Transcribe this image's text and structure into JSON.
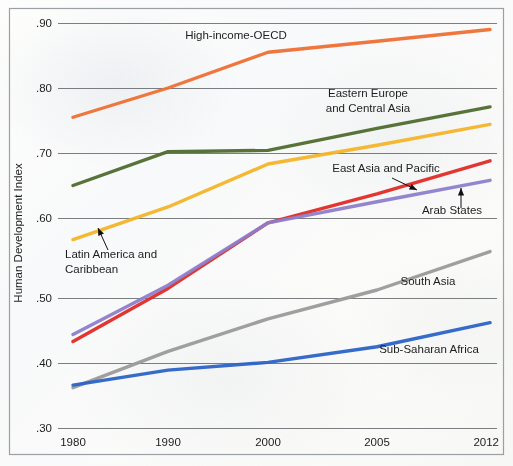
{
  "chart_data": {
    "type": "line",
    "title": "",
    "xlabel": "",
    "ylabel": "Human Development Index",
    "x": [
      "1980",
      "1990",
      "2000",
      "2005",
      "2012"
    ],
    "ylim": [
      0.3,
      0.9
    ],
    "ytick_labels": [
      ".90",
      ".80",
      ".70",
      ".60",
      ".50",
      ".40",
      ".30"
    ],
    "ytick_values": [
      0.9,
      0.8,
      0.7,
      0.6,
      0.5,
      0.4,
      0.3
    ],
    "grid": "horizontal",
    "legend": "inline-annotations",
    "series": [
      {
        "name": "High-income-OECD",
        "color": "#ee6f33",
        "values": [
          0.755,
          0.8,
          0.855,
          0.872,
          0.89
        ],
        "label_x": 236,
        "label_y": 39,
        "label_anchor": "middle",
        "annotation": "none"
      },
      {
        "name": "Eastern Europe and Central Asia",
        "color": "#4f6b2f",
        "values": [
          0.65,
          0.702,
          0.704,
          0.738,
          0.771
        ],
        "label_line1": "Eastern Europe",
        "label_line2": "and Central Asia",
        "label_x": 368,
        "label_y": 97,
        "label_anchor": "middle",
        "annotation": "none"
      },
      {
        "name": "Latin America and Caribbean",
        "color": "#f3b429",
        "values": [
          0.573,
          0.617,
          0.683,
          0.712,
          0.744
        ],
        "label_line1": "Latin America and",
        "label_line2": "Caribbean",
        "label_x": 65,
        "label_y": 258,
        "label_anchor": "start",
        "annotation": "arrow",
        "arrow_from_x": 108,
        "arrow_from_y": 250,
        "arrow_to_x": 98,
        "arrow_to_y": 228
      },
      {
        "name": "East Asia and Pacific",
        "color": "#e02b26",
        "values": [
          0.433,
          0.512,
          0.594,
          0.637,
          0.688
        ],
        "label_x": 386,
        "label_y": 172,
        "label_anchor": "middle",
        "annotation": "arrow",
        "arrow_from_x": 392,
        "arrow_from_y": 178,
        "arrow_to_x": 417,
        "arrow_to_y": 190
      },
      {
        "name": "Arab States",
        "color": "#8d7ecb",
        "values": [
          0.444,
          0.516,
          0.594,
          0.625,
          0.658
        ],
        "label_x": 452,
        "label_y": 214,
        "label_anchor": "middle",
        "annotation": "arrow",
        "arrow_from_x": 461,
        "arrow_from_y": 208,
        "arrow_to_x": 461,
        "arrow_to_y": 188
      },
      {
        "name": "South Asia",
        "color": "#9a9a9a",
        "values": [
          0.362,
          0.418,
          0.468,
          0.51,
          0.558
        ],
        "label_x": 428,
        "label_y": 285,
        "label_anchor": "middle",
        "annotation": "none"
      },
      {
        "name": "Sub-Saharan Africa",
        "color": "#2b63c6",
        "values": [
          0.366,
          0.389,
          0.401,
          0.425,
          0.462
        ],
        "label_x": 429,
        "label_y": 353,
        "label_anchor": "middle",
        "annotation": "none"
      }
    ]
  }
}
